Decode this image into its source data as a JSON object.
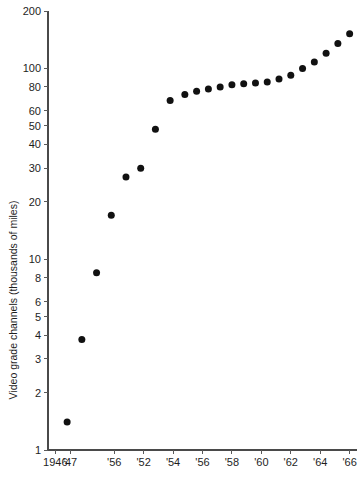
{
  "chart_data": {
    "type": "scatter",
    "title": "",
    "xlabel": "",
    "ylabel": "Video grade channels (thousands of miles)",
    "yscale": "log",
    "ylim": [
      1,
      200
    ],
    "xlim": [
      1945.5,
      1966.5
    ],
    "grid": false,
    "legend": null,
    "marker": "filled-circle",
    "marker_color": "#111111",
    "y_tick_labels": [
      "200",
      "100",
      "80",
      "60",
      "50",
      "40",
      "30",
      "20",
      "10",
      "8",
      "6",
      "5",
      "4",
      "3",
      "2",
      "1"
    ],
    "y_tick_values": [
      200,
      100,
      80,
      60,
      50,
      40,
      30,
      20,
      10,
      8,
      6,
      5,
      4,
      3,
      2,
      1
    ],
    "x_tick_labels": [
      "1946",
      "'47",
      "'56",
      "'52",
      "'54",
      "'56",
      "'58",
      "'60",
      "'62",
      "'64",
      "'66"
    ],
    "x_tick_values": [
      1946,
      1947,
      1950,
      1952,
      1954,
      1956,
      1958,
      1960,
      1962,
      1964,
      1966
    ],
    "x": [
      1946.8,
      1947.8,
      1948.8,
      1949.8,
      1950.8,
      1951.8,
      1952.8,
      1953.8,
      1954.8,
      1955.6,
      1956.4,
      1957.2,
      1958.0,
      1958.8,
      1959.6,
      1960.4,
      1961.2,
      1962.0,
      1962.8,
      1963.6,
      1964.4,
      1965.2,
      1966.0
    ],
    "values": [
      1.4,
      3.8,
      8.5,
      17.0,
      27.0,
      30.0,
      48.0,
      68.0,
      73.0,
      76.0,
      78.0,
      80.0,
      82.0,
      83.0,
      84.0,
      85.0,
      88.0,
      92.0,
      100.0,
      108.0,
      120.0,
      135.0,
      152.0
    ]
  },
  "axis": {
    "y_title": "Video grade channels (thousands of miles)"
  }
}
